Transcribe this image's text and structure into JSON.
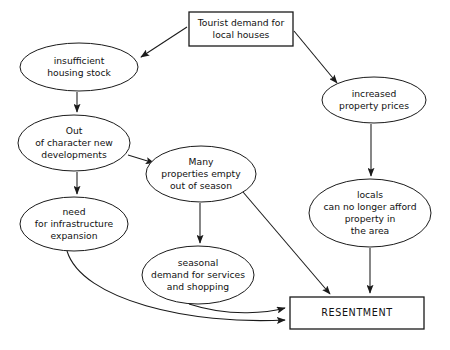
{
  "diagram": {
    "canvas": {
      "width": 450,
      "height": 350
    },
    "colors": {
      "background": "#ffffff",
      "stroke": "#1a1a1a",
      "text": "#111111",
      "node_fill": "#ffffff"
    },
    "nodes": [
      {
        "id": "tourist-demand",
        "shape": "rect",
        "label": "Tourist demand for local houses",
        "lines": [
          "Tourist demand for",
          "local houses"
        ],
        "x": 189,
        "y": 12,
        "w": 104,
        "h": 34
      },
      {
        "id": "insufficient-housing-stock",
        "shape": "ellipse",
        "label": "insufficient housing stock",
        "lines": [
          "insufficient",
          "housing stock"
        ],
        "cx": 79,
        "cy": 67,
        "rx": 59,
        "ry": 24
      },
      {
        "id": "increased-property-prices",
        "shape": "ellipse",
        "label": "increased property prices",
        "lines": [
          "increased",
          "property prices"
        ],
        "cx": 374,
        "cy": 100,
        "rx": 52,
        "ry": 23
      },
      {
        "id": "out-of-character-new-developments",
        "shape": "ellipse",
        "label": "Out of character new developments",
        "lines": [
          "Out",
          "of character new",
          "developments"
        ],
        "cx": 74,
        "cy": 143,
        "rx": 56,
        "ry": 28
      },
      {
        "id": "many-properties-empty",
        "shape": "ellipse",
        "label": "Many properties empty out of season",
        "lines": [
          "Many",
          "properties empty",
          "out of season"
        ],
        "cx": 201,
        "cy": 174,
        "rx": 55,
        "ry": 28
      },
      {
        "id": "locals-cannot-afford",
        "shape": "ellipse",
        "label": "locals can no longer afford property in the area",
        "lines": [
          "locals",
          "can no longer afford",
          "property in",
          "the area"
        ],
        "cx": 370,
        "cy": 213,
        "rx": 61,
        "ry": 34
      },
      {
        "id": "need-for-infrastructure-expansion",
        "shape": "ellipse",
        "label": "need for infrastructure expansion",
        "lines": [
          "need",
          "for infrastructure",
          "expansion"
        ],
        "cx": 74,
        "cy": 224,
        "rx": 54,
        "ry": 27
      },
      {
        "id": "seasonal-demand",
        "shape": "ellipse",
        "label": "seasonal demand for services and shopping",
        "lines": [
          "seasonal",
          "demand for services",
          "and shopping"
        ],
        "cx": 198,
        "cy": 275,
        "rx": 56,
        "ry": 29
      },
      {
        "id": "resentment",
        "shape": "rect",
        "label": "RESENTMENT",
        "lines": [
          "RESENTMENT"
        ],
        "x": 290,
        "y": 297,
        "w": 134,
        "h": 32
      }
    ],
    "edges": [
      {
        "id": "tourist-to-insufficient",
        "from": "tourist-demand",
        "to": "insufficient-housing-stock",
        "path": "M 187 27 L 141 57",
        "arrow": true
      },
      {
        "id": "tourist-to-prices",
        "from": "tourist-demand",
        "to": "increased-property-prices",
        "path": "M 294 31 L 337 83",
        "arrow": true
      },
      {
        "id": "insufficient-to-outofcharacter",
        "from": "insufficient-housing-stock",
        "to": "out-of-character-new-developments",
        "path": "M 77 92 L 77 112",
        "arrow": true
      },
      {
        "id": "outofcharacter-to-many",
        "from": "out-of-character-new-developments",
        "to": "many-properties-empty",
        "path": "M 128 155 L 154 163",
        "arrow": true
      },
      {
        "id": "outofcharacter-to-need",
        "from": "out-of-character-new-developments",
        "to": "need-for-infrastructure-expansion",
        "path": "M 77 172 L 77 194",
        "arrow": true
      },
      {
        "id": "prices-to-locals",
        "from": "increased-property-prices",
        "to": "locals-cannot-afford",
        "path": "M 371 124 L 371 176",
        "arrow": true
      },
      {
        "id": "many-to-seasonal",
        "from": "many-properties-empty",
        "to": "seasonal-demand",
        "path": "M 200 203 L 200 243",
        "arrow": true
      },
      {
        "id": "many-to-resentment",
        "from": "many-properties-empty",
        "to": "resentment",
        "path": "M 243 192 L 330 294",
        "arrow": true
      },
      {
        "id": "locals-to-resentment",
        "from": "locals-cannot-afford",
        "to": "resentment",
        "path": "M 370 248 L 370 293",
        "arrow": true
      },
      {
        "id": "seasonal-to-resentment",
        "from": "seasonal-demand",
        "to": "resentment",
        "path": "M 189 304 C 232 318, 270 312, 285 308",
        "arrow": true
      },
      {
        "id": "need-to-resentment",
        "from": "need-for-infrastructure-expansion",
        "to": "resentment",
        "path": "M 67 251 C 82 300, 190 325, 285 320",
        "arrow": true
      }
    ]
  }
}
